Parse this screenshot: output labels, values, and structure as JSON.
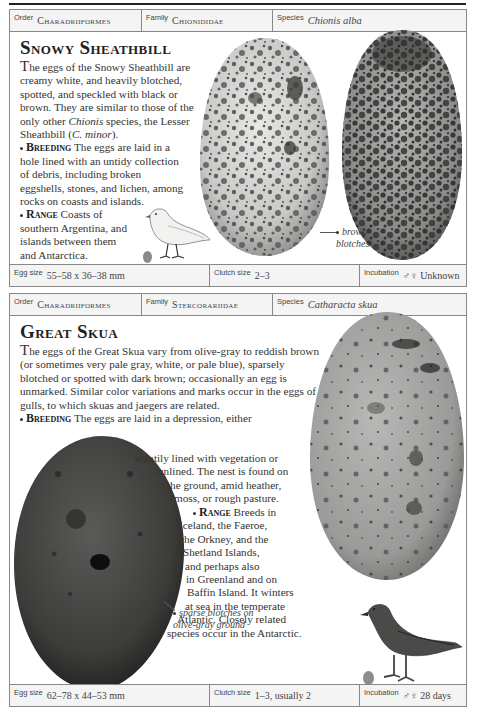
{
  "entries": [
    {
      "header": {
        "order_label": "Order",
        "order_value": "Charadriiformes",
        "family_label": "Family",
        "family_value": "Chionididae",
        "species_label": "Species",
        "species_value": "Chionis alba"
      },
      "title": "Snowy Sheathbill",
      "description": {
        "dropcap": "T",
        "text_before_italic": "he eggs of the Snowy Sheathbill are creamy white, and heavily blotched, spotted, and speckled with black or brown. They are similar to those of the only other ",
        "italic_1": "Chionis",
        "text_mid": " species, the Lesser Sheathbill (",
        "italic_2": "C. minor",
        "text_after": ")."
      },
      "breeding": {
        "keyword": "Breeding",
        "text": "The eggs are laid in a hole lined with an untidy collection of debris, including broken eggshells, stones, and lichen, among rocks on coasts and islands."
      },
      "range": {
        "keyword": "Range",
        "text": "Coasts of southern Argentina, and islands between them and Antarctica."
      },
      "annotation": {
        "line1": "brown",
        "line2": "blotches"
      },
      "figures": {
        "egg_left": "creamy white egg heavily blotched",
        "egg_right": "darker blotched egg",
        "bird": "snowy sheathbill illustration",
        "scale_egg_color": "#8a8a8a"
      },
      "footer": {
        "egg_size_label": "Egg size",
        "egg_size_value": "55–58 x 36–38 mm",
        "clutch_label": "Clutch size",
        "clutch_value": "2–3",
        "incubation_label": "Incubation",
        "incubation_value": "♂♀ Unknown"
      }
    },
    {
      "header": {
        "order_label": "Order",
        "order_value": "Charadriiformes",
        "family_label": "Family",
        "family_value": "Stercorariidae",
        "species_label": "Species",
        "species_value": "Catharacta skua"
      },
      "title": "Great Skua",
      "description": {
        "dropcap": "T",
        "text": "he eggs of the Great Skua vary from olive-gray to reddish brown (or sometimes very pale gray, white, or pale blue), sparsely blotched or spotted with dark brown; occasionally an egg is unmarked. Similar color variations and marks occur in the eggs of gulls, to which skuas and jaegers are related."
      },
      "breeding": {
        "keyword": "Breeding",
        "lines": [
          "The eggs are laid in a depression, either",
          "scantily lined with vegetation or",
          "unlined. The nest is found on",
          "the ground, amid heather,",
          "moss, or rough pasture."
        ]
      },
      "range": {
        "keyword": "Range",
        "lines": [
          "Breeds in",
          "Iceland, the Faeroe,",
          "the Orkney, and the",
          "Shetland Islands,",
          "and perhaps also",
          "in Greenland and on",
          "Baffin Island. It winters",
          "at sea in the temperate",
          "Atlantic. Closely related",
          "species occur in the Antarctic."
        ]
      },
      "annotation": {
        "line1": "sparse blotches on",
        "line2": "olive-gray ground"
      },
      "figures": {
        "egg_left": "dark olive-gray egg",
        "egg_right": "pale blotched egg",
        "bird": "great skua illustration",
        "scale_egg_color": "#8c8c8c"
      },
      "footer": {
        "egg_size_label": "Egg size",
        "egg_size_value": "62–78 x 44–53 mm",
        "clutch_label": "Clutch size",
        "clutch_value": "1–3, usually 2",
        "incubation_label": "Incubation",
        "incubation_value": "♂♀ 28 days"
      }
    }
  ]
}
